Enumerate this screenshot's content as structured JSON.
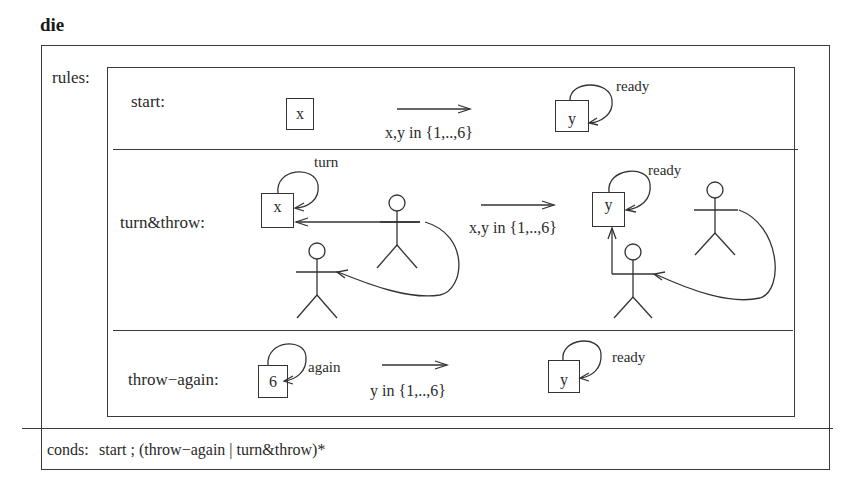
{
  "diagram": {
    "title": "die",
    "rules_label": "rules:",
    "conds": {
      "label": "conds:",
      "expression": "start ; (throw−again | turn&throw)*"
    },
    "rules": [
      {
        "name": "start:",
        "before": {
          "state": "x"
        },
        "transition": "x,y in {1,..,6}",
        "after": {
          "state": "y",
          "loop_label": "ready"
        }
      },
      {
        "name": "turn&throw:",
        "before": {
          "state": "x",
          "loop_label": "turn"
        },
        "transition": "x,y in {1,..,6}",
        "after": {
          "state": "y",
          "loop_label": "ready"
        }
      },
      {
        "name": "throw−again:",
        "before": {
          "state": "6",
          "loop_label": "again"
        },
        "transition": "y in {1,..,6}",
        "after": {
          "state": "y",
          "loop_label": "ready"
        }
      }
    ]
  }
}
